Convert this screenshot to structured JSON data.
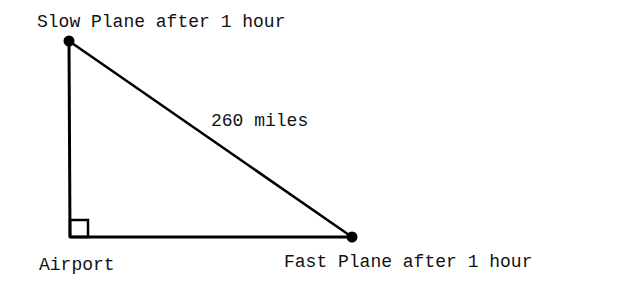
{
  "diagram": {
    "type": "right-triangle",
    "labels": {
      "top_vertex": "Slow Plane after 1 hour",
      "hypotenuse": "260 miles",
      "corner_vertex": "Airport",
      "right_vertex": "Fast Plane after 1 hour"
    },
    "vertices": {
      "slow_plane": [
        69,
        41
      ],
      "airport": [
        70,
        237
      ],
      "fast_plane": [
        352,
        237
      ]
    },
    "right_angle_marker": true,
    "colors": {
      "line": "#000000",
      "text": "#111111",
      "background": "#ffffff"
    }
  }
}
